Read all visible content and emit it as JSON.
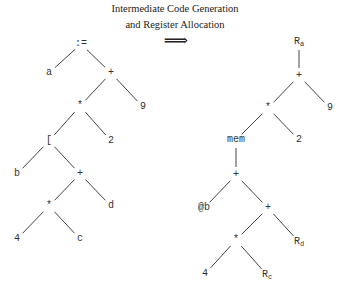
{
  "caption": {
    "line1": "Intermediate Code Generation",
    "line2": "and Register Allocation",
    "arrow": "⟹"
  },
  "left_tree": {
    "nodes": [
      {
        "id": "assign",
        "label": ":=",
        "x": 81,
        "y": 44
      },
      {
        "id": "a",
        "label": "a",
        "x": 49,
        "y": 73
      },
      {
        "id": "plus1",
        "label": "+",
        "x": 111,
        "y": 73
      },
      {
        "id": "mul1",
        "label": "*",
        "x": 80,
        "y": 106
      },
      {
        "id": "nine",
        "label": "9",
        "x": 143,
        "y": 107
      },
      {
        "id": "index",
        "label": "[",
        "x": 49,
        "y": 141
      },
      {
        "id": "two",
        "label": "2",
        "x": 111,
        "y": 141
      },
      {
        "id": "b",
        "label": "b",
        "x": 17,
        "y": 174
      },
      {
        "id": "plus2",
        "label": "+",
        "x": 80,
        "y": 174
      },
      {
        "id": "mul2",
        "label": "*",
        "x": 49,
        "y": 206
      },
      {
        "id": "d",
        "label": "d",
        "x": 111,
        "y": 206
      },
      {
        "id": "four",
        "label": "4",
        "x": 17,
        "y": 239
      },
      {
        "id": "c",
        "label": "c",
        "x": 80,
        "y": 239
      }
    ],
    "edges": [
      [
        "assign",
        "a"
      ],
      [
        "assign",
        "plus1"
      ],
      [
        "plus1",
        "mul1"
      ],
      [
        "plus1",
        "nine"
      ],
      [
        "mul1",
        "index"
      ],
      [
        "mul1",
        "two"
      ],
      [
        "index",
        "b"
      ],
      [
        "index",
        "plus2"
      ],
      [
        "plus2",
        "mul2"
      ],
      [
        "plus2",
        "d"
      ],
      [
        "mul2",
        "four"
      ],
      [
        "mul2",
        "c"
      ]
    ]
  },
  "right_tree": {
    "nodes": [
      {
        "id": "ra",
        "label": "R",
        "sub": "a",
        "x": 299,
        "y": 42
      },
      {
        "id": "rplus1",
        "label": "+",
        "x": 299,
        "y": 76
      },
      {
        "id": "rmul1",
        "label": "*",
        "x": 268,
        "y": 108
      },
      {
        "id": "rnine",
        "label": "9",
        "x": 330,
        "y": 108
      },
      {
        "id": "mem",
        "label": "mem",
        "x": 236,
        "y": 140
      },
      {
        "id": "rtwo",
        "label": "2",
        "x": 299,
        "y": 140
      },
      {
        "id": "rplus2",
        "label": "+",
        "x": 236,
        "y": 175
      },
      {
        "id": "atb",
        "label": "@b",
        "x": 204,
        "y": 208
      },
      {
        "id": "rplus3",
        "label": "+",
        "x": 268,
        "y": 208
      },
      {
        "id": "rmul2",
        "label": "*",
        "x": 236,
        "y": 240
      },
      {
        "id": "rd",
        "label": "R",
        "sub": "d",
        "x": 299,
        "y": 242
      },
      {
        "id": "rfour",
        "label": "4",
        "x": 205,
        "y": 274
      },
      {
        "id": "rc",
        "label": "R",
        "sub": "c",
        "x": 267,
        "y": 275
      }
    ],
    "edges": [
      [
        "ra",
        "rplus1"
      ],
      [
        "rplus1",
        "rmul1"
      ],
      [
        "rplus1",
        "rnine"
      ],
      [
        "rmul1",
        "mem"
      ],
      [
        "rmul1",
        "rtwo"
      ],
      [
        "mem",
        "rplus2"
      ],
      [
        "rplus2",
        "atb"
      ],
      [
        "rplus2",
        "rplus3"
      ],
      [
        "rplus3",
        "rmul2"
      ],
      [
        "rplus3",
        "rd"
      ],
      [
        "rmul2",
        "rfour"
      ],
      [
        "rmul2",
        "rc"
      ]
    ]
  },
  "style": {
    "line_color": "#444444",
    "text_color": "#333333"
  }
}
